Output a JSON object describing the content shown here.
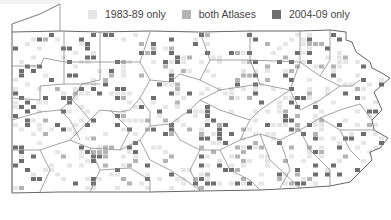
{
  "map": {
    "region": "Pennsylvania",
    "legend": [
      {
        "label": "1983-89 only",
        "color": "#e6e6e6"
      },
      {
        "label": "both Atlases",
        "color": "#b4b4b4"
      },
      {
        "label": "2004-09 only",
        "color": "#6e6e6e"
      }
    ],
    "colors": {
      "border": "#8a8a8a",
      "background": "#ffffff"
    }
  }
}
